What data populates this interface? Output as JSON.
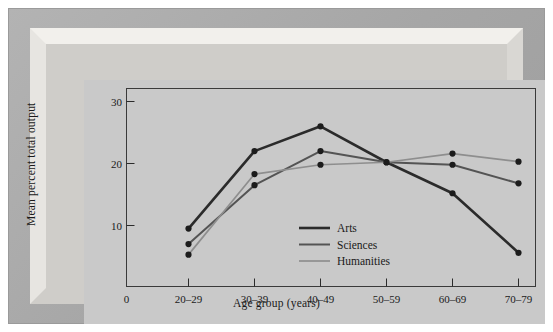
{
  "figure": {
    "frame_style": "beveled-mat",
    "background_color": "#c9c9c9",
    "frame_color": "#a9a9a9"
  },
  "chart_data": {
    "type": "line",
    "title": "",
    "xlabel": "Age group (years)",
    "ylabel": "Mean percent total output",
    "categories": [
      "20–29",
      "30–39",
      "40–49",
      "50–59",
      "60–69",
      "70–79"
    ],
    "x_origin_label": "0",
    "xtick_labels": [
      "0",
      "20–29",
      "30–39",
      "40–49",
      "50–59",
      "60–69",
      "70–79"
    ],
    "ytick_labels": [
      "10",
      "20",
      "30"
    ],
    "ytick_values": [
      10,
      20,
      30
    ],
    "ylim": [
      0,
      32
    ],
    "grid": false,
    "legend_position": "center",
    "markers": "filled-circle",
    "series": [
      {
        "name": "Arts",
        "color": "#2b2b2b",
        "line_width": 2.6,
        "values": [
          9.5,
          22.0,
          26.0,
          20.2,
          15.2,
          5.6
        ]
      },
      {
        "name": "Sciences",
        "color": "#545454",
        "line_width": 2.0,
        "values": [
          7.0,
          16.5,
          22.0,
          20.2,
          19.8,
          16.8
        ]
      },
      {
        "name": "Humanities",
        "color": "#8e8e8e",
        "line_width": 1.7,
        "values": [
          5.3,
          18.3,
          19.8,
          20.2,
          21.6,
          20.3
        ]
      }
    ],
    "legend_entries": [
      {
        "label": "Arts",
        "color": "#2b2b2b"
      },
      {
        "label": "Sciences",
        "color": "#545454"
      },
      {
        "label": "Humanities",
        "color": "#8e8e8e"
      }
    ]
  }
}
